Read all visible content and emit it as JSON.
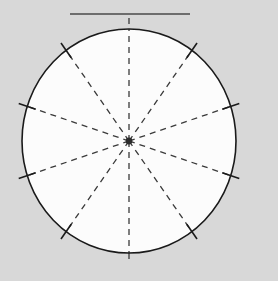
{
  "figure": {
    "title": "",
    "kind": "geometric-diagram",
    "description": "Circle with ten dashed radial spokes, center dot, edge tick marks and a solid horizontal reference line above the circle",
    "canvas": {
      "width": 278,
      "height": 281,
      "background_color": "#d8d8d8",
      "plot_background_color": "#fcfcfc"
    },
    "colors": {
      "circle_stroke": "#1a1a1a",
      "spoke_stroke": "#3a3a3a",
      "tick_stroke": "#1a1a1a",
      "center_dot": "#2b2b2b",
      "reference_line": "#4a4a4a",
      "page_background": "#d8d8d8",
      "interior_fill": "#fcfcfc"
    },
    "circle": {
      "label": "main-circle",
      "center_x": 129,
      "center_y": 141,
      "radius_x": 107,
      "radius_y": 112,
      "stroke_width": 1.6,
      "fill": "#fcfcfc"
    },
    "center_point": {
      "label": "center-dot",
      "x": 129,
      "y": 141,
      "radius": 3.4
    },
    "reference_line": {
      "label": "top-horizontal-line",
      "x1": 70,
      "y1": 14,
      "x2": 190,
      "y2": 14,
      "stroke_width": 1.4
    },
    "spokes": {
      "count": 10,
      "spacing_degrees": 36,
      "style": "dashed",
      "dash_pattern": "6 5",
      "stroke_width": 1.3,
      "angles_degrees": [
        90,
        126,
        162,
        198,
        234,
        270,
        306,
        342,
        18,
        54
      ],
      "items": [
        {
          "label": "spoke-090",
          "angle": 90
        },
        {
          "label": "spoke-126",
          "angle": 126
        },
        {
          "label": "spoke-162",
          "angle": 162
        },
        {
          "label": "spoke-198",
          "angle": 198
        },
        {
          "label": "spoke-234",
          "angle": 234
        },
        {
          "label": "spoke-270",
          "angle": 270
        },
        {
          "label": "spoke-306",
          "angle": 306
        },
        {
          "label": "spoke-342",
          "angle": 342
        },
        {
          "label": "spoke-018",
          "angle": 18
        },
        {
          "label": "spoke-054",
          "angle": 54
        }
      ]
    },
    "vertical_axis": {
      "label": "vertical-diameter-extension",
      "style": "dashed",
      "top_y": 18,
      "bottom_y": 264,
      "x": 129
    },
    "ticks": {
      "count": 8,
      "length": 18,
      "stroke_width": 1.6,
      "angles_degrees": [
        126,
        162,
        198,
        234,
        306,
        342,
        18,
        54
      ],
      "items": [
        {
          "label": "tick-126",
          "angle": 126
        },
        {
          "label": "tick-162",
          "angle": 162
        },
        {
          "label": "tick-198",
          "angle": 198
        },
        {
          "label": "tick-234",
          "angle": 234
        },
        {
          "label": "tick-306",
          "angle": 306
        },
        {
          "label": "tick-342",
          "angle": 342
        },
        {
          "label": "tick-018",
          "angle": 18
        },
        {
          "label": "tick-054",
          "angle": 54
        }
      ]
    }
  }
}
